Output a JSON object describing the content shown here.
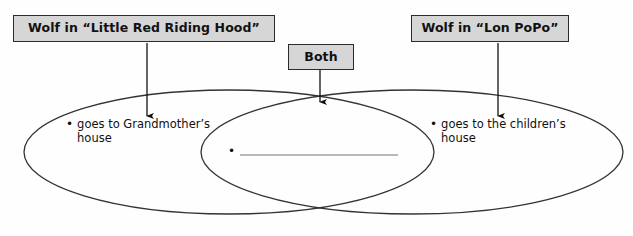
{
  "diagram": {
    "type": "venn-diagram",
    "title_labels": {
      "left": "Wolf in “Little Red Riding Hood”",
      "center": "Both",
      "right": "Wolf in “Lon PoPo”"
    },
    "regions": {
      "left_only": {
        "bullet": "•",
        "text": "goes to Grandmother’s house"
      },
      "intersection": {
        "bullet": "•",
        "text": ""
      },
      "right_only": {
        "bullet": "•",
        "text": "goes to the children’s house"
      }
    },
    "colors": {
      "box_fill": "#d6d6d6",
      "box_border": "#2b2b2b",
      "ellipse_stroke": "#333333",
      "arrow": "#111111",
      "answer_line": "#b9b9b9",
      "background": "#fefefe"
    }
  }
}
